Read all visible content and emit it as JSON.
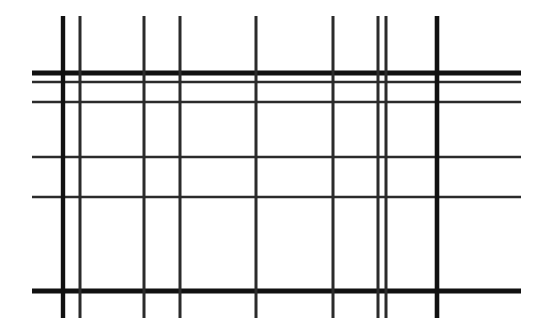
{
  "figure": {
    "canvas": {
      "width": 540,
      "height": 330,
      "background_color": "#ffffff"
    },
    "ink_color": "#111111",
    "ink_color_soft": "#2b2b2b"
  },
  "chart_data": {
    "type": "line",
    "subtitle": "",
    "xlabel": "",
    "ylabel": "",
    "xlim": [
      0,
      540
    ],
    "ylim": [
      0,
      330
    ],
    "grid": true,
    "legend": "none",
    "units": "pixels",
    "horizontal_lines": [
      {
        "id": "h1",
        "y": 73,
        "thickness": 5.0,
        "x_start": 32,
        "x_end": 521,
        "weight": "heavy"
      },
      {
        "id": "h2",
        "y": 82,
        "thickness": 2.6,
        "x_start": 32,
        "x_end": 521,
        "weight": "light"
      },
      {
        "id": "h3",
        "y": 102,
        "thickness": 2.6,
        "x_start": 32,
        "x_end": 521,
        "weight": "light"
      },
      {
        "id": "h4",
        "y": 157,
        "thickness": 2.6,
        "x_start": 32,
        "x_end": 521,
        "weight": "light"
      },
      {
        "id": "h5",
        "y": 197,
        "thickness": 2.6,
        "x_start": 32,
        "x_end": 521,
        "weight": "light"
      },
      {
        "id": "h6",
        "y": 291,
        "thickness": 5.0,
        "x_start": 32,
        "x_end": 521,
        "weight": "heavy"
      }
    ],
    "vertical_lines": [
      {
        "id": "v1",
        "x": 63,
        "thickness": 4.4,
        "y_start": 16,
        "y_end": 318,
        "weight": "heavy"
      },
      {
        "id": "v2",
        "x": 80,
        "thickness": 3.0,
        "y_start": 16,
        "y_end": 318,
        "weight": "light"
      },
      {
        "id": "v3",
        "x": 144,
        "thickness": 3.0,
        "y_start": 16,
        "y_end": 318,
        "weight": "light"
      },
      {
        "id": "v4",
        "x": 180,
        "thickness": 3.0,
        "y_start": 16,
        "y_end": 318,
        "weight": "light"
      },
      {
        "id": "v5",
        "x": 256,
        "thickness": 3.0,
        "y_start": 16,
        "y_end": 318,
        "weight": "light"
      },
      {
        "id": "v6",
        "x": 333,
        "thickness": 3.0,
        "y_start": 16,
        "y_end": 318,
        "weight": "light"
      },
      {
        "id": "v7",
        "x": 378,
        "thickness": 3.0,
        "y_start": 16,
        "y_end": 318,
        "weight": "light"
      },
      {
        "id": "v8",
        "x": 386,
        "thickness": 3.0,
        "y_start": 16,
        "y_end": 318,
        "weight": "light"
      },
      {
        "id": "v9",
        "x": 437,
        "thickness": 4.6,
        "y_start": 16,
        "y_end": 318,
        "weight": "heavy"
      }
    ],
    "counts": {
      "horizontal": 6,
      "vertical": 9,
      "intersections": 54
    }
  }
}
